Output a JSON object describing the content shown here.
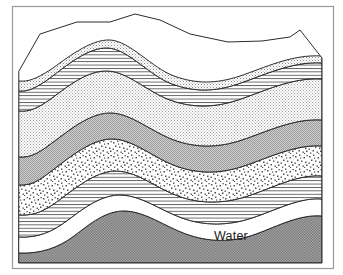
{
  "diagram": {
    "labels": [
      {
        "id": "water",
        "text": "Water",
        "x": 231,
        "y": 240
      }
    ],
    "colors": {
      "outline": "#2b2b2b",
      "frame": "#9a9a9a",
      "background": "#ffffff",
      "surface_white": "#ffffff",
      "fine_stipple": "#e8e8e8",
      "horizontal_lines": "#f2f2f2",
      "light_dotted": "#ededed",
      "solid_gray": "#b9b9b9",
      "coarse_stipple": "#e4e4e4",
      "basement_dark": "#8d8d8d",
      "water_fill": "#ffffff",
      "label_text": "#1a1a1a"
    },
    "layers": [
      {
        "id": "surface",
        "name": "land-surface-top",
        "pattern": "blank-white",
        "order": 0,
        "description": "White upper land surface of the block"
      },
      {
        "id": "fine-stipple-upper",
        "name": "fine-stipple-bed",
        "pattern": "fine-stipple",
        "order": 1,
        "description": "Fine dotted sandy bed beneath the surface"
      },
      {
        "id": "horizontal-lines-upper",
        "name": "horizontal-line-bed-upper",
        "pattern": "horizontal-lines",
        "order": 2,
        "description": "Ruled horizontal-line shale bed, folded into an anticline"
      },
      {
        "id": "light-dotted-thick",
        "name": "light-dotted-bed",
        "pattern": "light-dotted",
        "order": 3,
        "description": "Thick pale stippled bed"
      },
      {
        "id": "solid-gray",
        "name": "solid-gray-bed",
        "pattern": "solid-gray",
        "order": 4,
        "description": "Solid medium-gray bed"
      },
      {
        "id": "coarse-stipple",
        "name": "coarse-stipple-bed",
        "pattern": "coarse-stipple",
        "order": 5,
        "description": "Coarse random-speckle gravel/aquifer bed"
      },
      {
        "id": "horizontal-lines-lower",
        "name": "horizontal-line-bed-lower",
        "pattern": "horizontal-lines",
        "order": 6,
        "description": "Lower ruled horizontal-line confining bed"
      },
      {
        "id": "water-lens",
        "name": "water-lens",
        "pattern": "blank-white",
        "order": 7,
        "description": "White lens-shaped water body labelled Water"
      },
      {
        "id": "basement",
        "name": "basement-bedrock",
        "pattern": "dense-checker",
        "order": 8,
        "description": "Dark checkered basement bedrock at the base"
      }
    ]
  }
}
